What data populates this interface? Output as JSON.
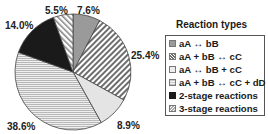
{
  "chart_data": {
    "type": "pie",
    "title": "",
    "legend_title": "Reaction types",
    "legend_position": "right",
    "start_angle": "12 o'clock",
    "direction": "clockwise",
    "categories": [
      "aA ↔ bB",
      "aA + bB ↔ cC",
      "aA ↔ bB + cC",
      "aA + bB ↔ cC + dD",
      "2-stage reactions",
      "3-stage reactions"
    ],
    "values": [
      7.6,
      25.4,
      8.9,
      38.6,
      14.0,
      5.5
    ],
    "labels": [
      "7.6%",
      "25.4%",
      "8.9%",
      "38.6%",
      "14.0%",
      "5.5%"
    ],
    "fills": [
      "solid-gray",
      "diagonal-hatch",
      "light-gray",
      "horizontal-lines",
      "black",
      "white-diagonal-hatch"
    ],
    "colors": [
      "#9a9a9a",
      "#6e6e6e",
      "#dcdcdc",
      "#c8c8c8",
      "#1a1a1a",
      "#bdbdbd"
    ]
  }
}
